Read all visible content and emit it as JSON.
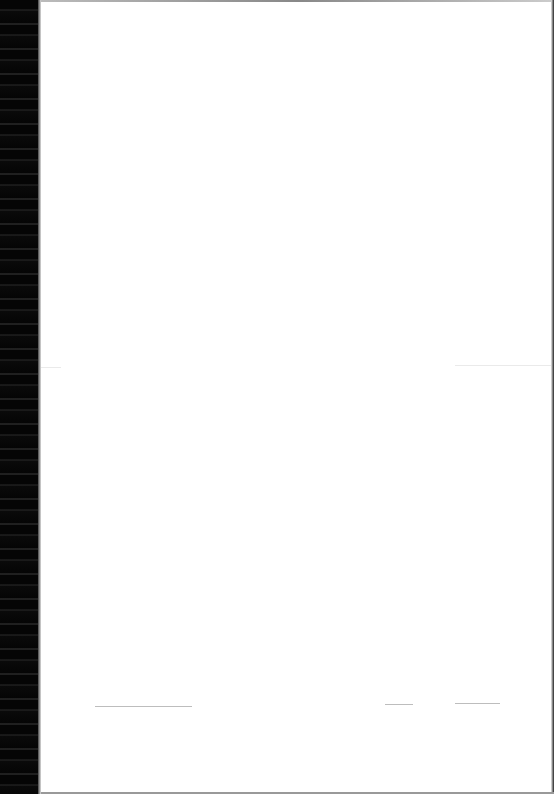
{
  "document": {
    "type": "scanned-page",
    "content": "",
    "signature_lines": [
      {
        "id": "left",
        "x": 95,
        "y": 706,
        "width": 97
      },
      {
        "id": "middle",
        "x": 385,
        "y": 704,
        "width": 28
      },
      {
        "id": "right",
        "x": 455,
        "y": 703,
        "width": 45
      }
    ]
  },
  "colors": {
    "page": "#ffffff",
    "binding": "#080808",
    "line": "#bdbdbd"
  }
}
